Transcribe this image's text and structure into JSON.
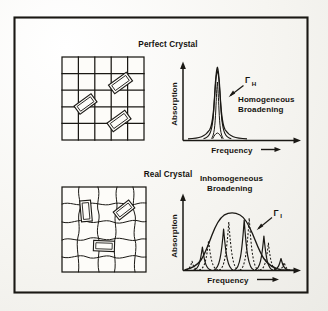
{
  "figure": {
    "background_color": "#faf9f6",
    "ink_color": "#1a1814",
    "border": {
      "x": 14,
      "y": 17,
      "width": 294,
      "height": 276
    }
  },
  "panels": [
    {
      "id": "perfect-crystal",
      "title": "Perfect Crystal",
      "lattice": {
        "kind": "regular-grid",
        "rows": 5,
        "cols": 5,
        "defect_count": 3,
        "defect_shape": "tilted-rectangle"
      },
      "chart": {
        "type": "line",
        "title": "",
        "xlabel": "Frequency",
        "ylabel": "Absorption",
        "x_arrow": true,
        "y_arrow": true,
        "annotation_label": "Γ",
        "annotation_subscript": "H",
        "caption_line1": "Homogeneous",
        "caption_line2": "Broadening",
        "peaks": [
          {
            "center": 0.5,
            "height": 1.0,
            "width": 0.055,
            "style": "solid"
          }
        ],
        "envelope": false,
        "xlim": [
          0,
          1
        ],
        "ylim": [
          0,
          1.05
        ],
        "grid": false
      }
    },
    {
      "id": "real-crystal",
      "title": "Real Crystal",
      "lattice": {
        "kind": "distorted-grid",
        "rows": 5,
        "cols": 5,
        "defect_count": 3,
        "defect_shape": "tilted-rectangle"
      },
      "chart": {
        "type": "line",
        "title": "",
        "xlabel": "Frequency",
        "ylabel": "Absorption",
        "x_arrow": true,
        "y_arrow": true,
        "annotation_label": "Γ",
        "annotation_subscript": "I",
        "caption_line1": "Inhomogeneous",
        "caption_line2": "Broadening",
        "envelope": true,
        "envelope_center": 0.5,
        "envelope_height": 0.86,
        "envelope_width": 0.3,
        "peaks": [
          {
            "center": 0.085,
            "height": 0.14,
            "width": 0.022,
            "style": "dashed"
          },
          {
            "center": 0.205,
            "height": 0.45,
            "width": 0.022,
            "style": "solid"
          },
          {
            "center": 0.32,
            "height": 0.7,
            "width": 0.022,
            "style": "dashed"
          },
          {
            "center": 0.435,
            "height": 0.82,
            "width": 0.022,
            "style": "solid"
          },
          {
            "center": 0.56,
            "height": 0.8,
            "width": 0.022,
            "style": "dashed"
          },
          {
            "center": 0.68,
            "height": 0.62,
            "width": 0.022,
            "style": "solid"
          },
          {
            "center": 0.8,
            "height": 0.33,
            "width": 0.022,
            "style": "dashed"
          },
          {
            "center": 0.905,
            "height": 0.13,
            "width": 0.022,
            "style": "solid"
          }
        ],
        "xlim": [
          0,
          1
        ],
        "ylim": [
          0,
          1.0
        ],
        "grid": false
      }
    }
  ]
}
